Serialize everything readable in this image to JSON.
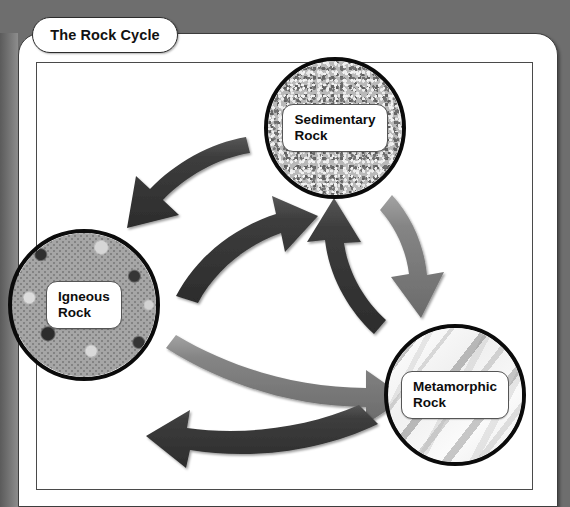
{
  "page": {
    "title": "The Rock Cycle",
    "background_color": "#6e6e6e",
    "sheet_color": "#ffffff"
  },
  "diagram": {
    "type": "cycle-diagram",
    "nodes": [
      {
        "id": "sedimentary",
        "label_line1": "Sedimentary",
        "label_line2": "Rock",
        "texture": "speckled-granular-gray",
        "position": "top-center"
      },
      {
        "id": "igneous",
        "label_line1": "Igneous",
        "label_line2": "Rock",
        "texture": "mottled-dark-gray",
        "position": "left"
      },
      {
        "id": "metamorphic",
        "label_line1": "Metamorphic",
        "label_line2": "Rock",
        "texture": "white-marble-banded",
        "position": "bottom-right"
      }
    ],
    "arrows": [
      {
        "id": "sedimentary-to-igneous",
        "from": "sedimentary",
        "to": "igneous",
        "shade": "dark"
      },
      {
        "id": "igneous-to-sedimentary",
        "from": "igneous",
        "to": "sedimentary",
        "shade": "dark"
      },
      {
        "id": "metamorphic-to-sedimentary",
        "from": "metamorphic",
        "to": "sedimentary",
        "shade": "dark"
      },
      {
        "id": "sedimentary-to-metamorphic",
        "from": "sedimentary",
        "to": "metamorphic",
        "shade": "light"
      },
      {
        "id": "igneous-to-metamorphic",
        "from": "igneous",
        "to": "metamorphic",
        "shade": "light"
      },
      {
        "id": "metamorphic-to-igneous",
        "from": "metamorphic",
        "to": "igneous",
        "shade": "dark"
      }
    ],
    "colors": {
      "arrow_dark": "#3a3a3a",
      "arrow_light": "#7a7a7a",
      "node_outline": "#0b0b0b",
      "frame_line": "#4a4a4a"
    }
  }
}
